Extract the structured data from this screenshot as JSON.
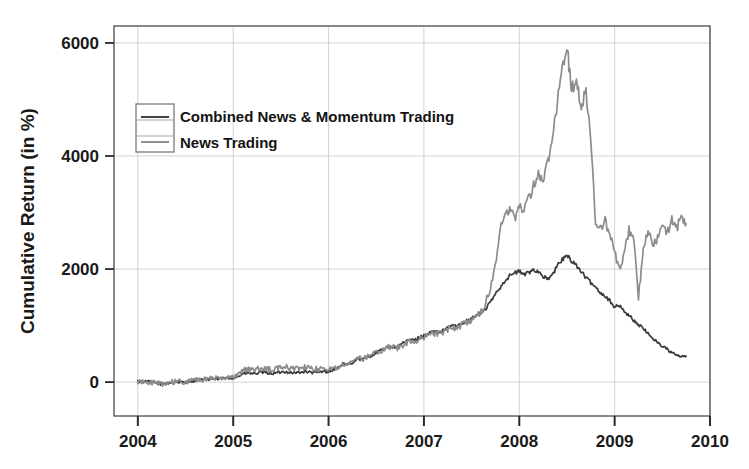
{
  "chart_data": {
    "type": "line",
    "title": "",
    "subtitle": "",
    "xlabel": "",
    "ylabel": "Cumulative Return (in %)",
    "xlim": [
      2003.75,
      2010.0
    ],
    "ylim": [
      -600,
      6300
    ],
    "xticks": [
      "2004",
      "2005",
      "2006",
      "2007",
      "2008",
      "2009",
      "2010"
    ],
    "xtick_values": [
      2004,
      2005,
      2006,
      2007,
      2008,
      2009,
      2010
    ],
    "yticks": [
      "0",
      "2000",
      "4000",
      "6000"
    ],
    "ytick_values": [
      0,
      2000,
      4000,
      6000
    ],
    "grid": true,
    "grid_color": "#c8c8c8",
    "legend_position": "upper-left-inside",
    "axis_color": "#4a4a4a",
    "background": "#ffffff",
    "series": [
      {
        "name": "Combined News & Momentum Trading",
        "color": "#3a3a3a",
        "linewidth": 1.7,
        "x": [
          2004.0,
          2004.05,
          2004.1,
          2004.15,
          2004.2,
          2004.25,
          2004.3,
          2004.35,
          2004.4,
          2004.45,
          2004.5,
          2004.55,
          2004.6,
          2004.65,
          2004.7,
          2004.75,
          2004.8,
          2004.85,
          2004.9,
          2004.95,
          2005.0,
          2005.05,
          2005.1,
          2005.15,
          2005.2,
          2005.25,
          2005.3,
          2005.35,
          2005.4,
          2005.45,
          2005.5,
          2005.55,
          2005.6,
          2005.65,
          2005.7,
          2005.75,
          2005.8,
          2005.85,
          2005.9,
          2005.95,
          2006.0,
          2006.05,
          2006.1,
          2006.15,
          2006.2,
          2006.25,
          2006.3,
          2006.35,
          2006.4,
          2006.45,
          2006.5,
          2006.55,
          2006.6,
          2006.65,
          2006.7,
          2006.75,
          2006.8,
          2006.85,
          2006.9,
          2006.95,
          2007.0,
          2007.05,
          2007.1,
          2007.15,
          2007.2,
          2007.25,
          2007.3,
          2007.35,
          2007.4,
          2007.45,
          2007.5,
          2007.55,
          2007.6,
          2007.65,
          2007.7,
          2007.75,
          2007.8,
          2007.85,
          2007.9,
          2007.95,
          2008.0,
          2008.05,
          2008.1,
          2008.15,
          2008.2,
          2008.25,
          2008.3,
          2008.35,
          2008.4,
          2008.45,
          2008.5,
          2008.55,
          2008.6,
          2008.65,
          2008.7,
          2008.75,
          2008.8,
          2008.85,
          2008.9,
          2008.95,
          2009.0,
          2009.05,
          2009.1,
          2009.15,
          2009.2,
          2009.25,
          2009.3,
          2009.35,
          2009.4,
          2009.45,
          2009.5,
          2009.55,
          2009.6,
          2009.65,
          2009.7,
          2009.75
        ],
        "y": [
          10,
          5,
          12,
          -5,
          -20,
          -35,
          -20,
          -10,
          5,
          -5,
          0,
          15,
          25,
          40,
          35,
          50,
          60,
          55,
          70,
          65,
          80,
          95,
          145,
          160,
          150,
          155,
          170,
          165,
          150,
          160,
          175,
          185,
          170,
          160,
          175,
          185,
          175,
          165,
          175,
          190,
          185,
          215,
          260,
          320,
          300,
          340,
          420,
          400,
          430,
          470,
          520,
          560,
          600,
          640,
          610,
          660,
          700,
          760,
          740,
          790,
          820,
          860,
          900,
          870,
          910,
          960,
          1010,
          980,
          1040,
          1090,
          1130,
          1180,
          1230,
          1300,
          1420,
          1560,
          1680,
          1800,
          1880,
          1930,
          1960,
          1900,
          1940,
          1990,
          1960,
          1870,
          1820,
          1900,
          2060,
          2170,
          2230,
          2150,
          2060,
          1960,
          1840,
          1760,
          1680,
          1590,
          1520,
          1440,
          1330,
          1350,
          1260,
          1180,
          1090,
          1020,
          940,
          860,
          780,
          700,
          640,
          580,
          520,
          470,
          450,
          460
        ]
      },
      {
        "name": "News Trading",
        "color": "#8c8c8c",
        "linewidth": 1.7,
        "x": [
          2004.0,
          2004.05,
          2004.1,
          2004.15,
          2004.2,
          2004.25,
          2004.3,
          2004.35,
          2004.4,
          2004.45,
          2004.5,
          2004.55,
          2004.6,
          2004.65,
          2004.7,
          2004.75,
          2004.8,
          2004.85,
          2004.9,
          2004.95,
          2005.0,
          2005.05,
          2005.1,
          2005.15,
          2005.2,
          2005.25,
          2005.3,
          2005.35,
          2005.4,
          2005.45,
          2005.5,
          2005.55,
          2005.6,
          2005.65,
          2005.7,
          2005.75,
          2005.8,
          2005.85,
          2005.9,
          2005.95,
          2006.0,
          2006.05,
          2006.1,
          2006.15,
          2006.2,
          2006.25,
          2006.3,
          2006.35,
          2006.4,
          2006.45,
          2006.5,
          2006.55,
          2006.6,
          2006.65,
          2006.7,
          2006.75,
          2006.8,
          2006.85,
          2006.9,
          2006.95,
          2007.0,
          2007.05,
          2007.1,
          2007.15,
          2007.2,
          2007.25,
          2007.3,
          2007.35,
          2007.4,
          2007.45,
          2007.5,
          2007.55,
          2007.6,
          2007.65,
          2007.7,
          2007.75,
          2007.8,
          2007.85,
          2007.9,
          2007.95,
          2008.0,
          2008.05,
          2008.1,
          2008.15,
          2008.2,
          2008.25,
          2008.3,
          2008.35,
          2008.4,
          2008.45,
          2008.5,
          2008.52,
          2008.55,
          2008.6,
          2008.65,
          2008.7,
          2008.75,
          2008.8,
          2008.85,
          2008.9,
          2008.95,
          2009.0,
          2009.05,
          2009.1,
          2009.15,
          2009.2,
          2009.25,
          2009.3,
          2009.35,
          2009.4,
          2009.45,
          2009.5,
          2009.55,
          2009.6,
          2009.65,
          2009.7,
          2009.75
        ],
        "y": [
          5,
          8,
          0,
          -10,
          -25,
          -30,
          -15,
          -5,
          10,
          0,
          10,
          20,
          30,
          45,
          40,
          55,
          70,
          65,
          80,
          75,
          95,
          120,
          200,
          230,
          215,
          225,
          250,
          235,
          215,
          230,
          255,
          265,
          245,
          230,
          245,
          260,
          240,
          225,
          235,
          250,
          230,
          240,
          270,
          330,
          305,
          345,
          425,
          405,
          435,
          475,
          510,
          545,
          585,
          625,
          590,
          630,
          680,
          735,
          700,
          755,
          790,
          830,
          870,
          845,
          880,
          930,
          975,
          945,
          1010,
          1060,
          1110,
          1165,
          1240,
          1420,
          1680,
          2050,
          2700,
          2980,
          3050,
          2900,
          3120,
          3060,
          3250,
          3480,
          3700,
          3520,
          3900,
          4350,
          4950,
          5500,
          5950,
          5600,
          5200,
          5300,
          4900,
          5150,
          4350,
          2750,
          2720,
          2850,
          2600,
          2300,
          1980,
          2250,
          2700,
          2550,
          1500,
          2300,
          2700,
          2400,
          2550,
          2750,
          2620,
          2900,
          2700,
          2950,
          2800
        ]
      }
    ]
  },
  "legend": {
    "items": [
      {
        "label": "Combined News & Momentum Trading",
        "color": "#3a3a3a"
      },
      {
        "label": "News Trading",
        "color": "#8c8c8c"
      }
    ]
  },
  "axes": {
    "y_axis_title": "Cumulative Return (in %)",
    "y_ticks": [
      "6000",
      "4000",
      "2000",
      "0"
    ],
    "x_ticks": [
      "2004",
      "2005",
      "2006",
      "2007",
      "2008",
      "2009",
      "2010"
    ]
  }
}
